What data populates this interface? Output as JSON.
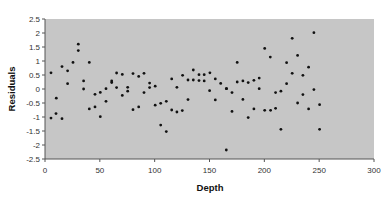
{
  "chart_data": {
    "type": "scatter",
    "title": "",
    "xlabel": "Depth",
    "ylabel": "Residuals",
    "xlim": [
      0,
      300
    ],
    "ylim": [
      -2.5,
      2.5
    ],
    "xticks": [
      0,
      50,
      100,
      150,
      200,
      250,
      300
    ],
    "yticks": [
      2.5,
      2,
      1.5,
      1,
      0.5,
      0,
      -0.5,
      -1,
      -1.5,
      -2,
      -2.5
    ],
    "ytick_labels": [
      "2.5",
      "2",
      "1.5",
      "1",
      "0.5",
      "0",
      "-0.5",
      "-1",
      "-1.5",
      "-2",
      "-2.5"
    ],
    "xtick_labels": [
      "0",
      "50",
      "100",
      "150",
      "200",
      "250",
      "300"
    ],
    "grid": false,
    "legend": null,
    "background": "#c6c6c6",
    "marker_color": "#111111",
    "points": [
      [
        5.5,
        0.58
      ],
      [
        10.3,
        -0.33
      ],
      [
        5.5,
        -1.04
      ],
      [
        10.0,
        -0.88
      ],
      [
        15.5,
        -1.06
      ],
      [
        15.5,
        0.8
      ],
      [
        20.6,
        0.65
      ],
      [
        20.6,
        0.19
      ],
      [
        25.5,
        0.95
      ],
      [
        30.4,
        1.6
      ],
      [
        30.4,
        1.37
      ],
      [
        40.4,
        0.95
      ],
      [
        35.2,
        0.29
      ],
      [
        35.2,
        0.0
      ],
      [
        45.6,
        -0.19
      ],
      [
        50.4,
        -0.12
      ],
      [
        55.6,
        0.01
      ],
      [
        55.6,
        -0.44
      ],
      [
        40.4,
        -0.71
      ],
      [
        45.6,
        -0.64
      ],
      [
        50.4,
        -0.99
      ],
      [
        65.3,
        0.57
      ],
      [
        70.5,
        0.52
      ],
      [
        80.2,
        0.55
      ],
      [
        85.4,
        0.45
      ],
      [
        90.3,
        0.56
      ],
      [
        60.8,
        0.29
      ],
      [
        60.8,
        0.23
      ],
      [
        95.4,
        0.21
      ],
      [
        100.5,
        0.1
      ],
      [
        95.4,
        0.05
      ],
      [
        65.3,
        0.05
      ],
      [
        75.4,
        0.06
      ],
      [
        75.4,
        -0.08
      ],
      [
        70.5,
        -0.23
      ],
      [
        90.3,
        -0.13
      ],
      [
        100.5,
        -0.58
      ],
      [
        105.5,
        -0.51
      ],
      [
        110.6,
        -0.44
      ],
      [
        85.4,
        -0.64
      ],
      [
        80.2,
        -0.74
      ],
      [
        105.5,
        -1.29
      ],
      [
        110.6,
        -1.52
      ],
      [
        115.5,
        0.36
      ],
      [
        125.5,
        0.49
      ],
      [
        135.2,
        0.68
      ],
      [
        130.4,
        0.32
      ],
      [
        135.2,
        0.32
      ],
      [
        140.4,
        0.51
      ],
      [
        145.2,
        0.51
      ],
      [
        140.4,
        0.3
      ],
      [
        145.2,
        0.29
      ],
      [
        150.4,
        0.58
      ],
      [
        155.3,
        0.36
      ],
      [
        160.2,
        0.2
      ],
      [
        120.3,
        0.06
      ],
      [
        150.1,
        -0.06
      ],
      [
        165.3,
        0.01
      ],
      [
        130.4,
        -0.38
      ],
      [
        155.3,
        -0.39
      ],
      [
        115.5,
        -0.75
      ],
      [
        120.3,
        -0.82
      ],
      [
        125.2,
        -0.77
      ],
      [
        165.3,
        -2.18
      ],
      [
        200.3,
        1.45
      ],
      [
        205.4,
        1.14
      ],
      [
        175.3,
        0.95
      ],
      [
        175.3,
        0.25
      ],
      [
        180.5,
        0.29
      ],
      [
        185.3,
        0.23
      ],
      [
        190.5,
        0.31
      ],
      [
        195.3,
        0.39
      ],
      [
        165.6,
        0.01
      ],
      [
        170.5,
        -0.13
      ],
      [
        195.3,
        0.01
      ],
      [
        180.5,
        -0.37
      ],
      [
        170.5,
        -0.8
      ],
      [
        190.5,
        -0.71
      ],
      [
        200.3,
        -0.76
      ],
      [
        185.3,
        -1.02
      ],
      [
        245.2,
        2.01
      ],
      [
        225.4,
        1.81
      ],
      [
        230.3,
        1.2
      ],
      [
        220.3,
        0.94
      ],
      [
        240.4,
        0.78
      ],
      [
        225.4,
        0.56
      ],
      [
        235.2,
        0.49
      ],
      [
        220.3,
        0.19
      ],
      [
        210.3,
        -0.13
      ],
      [
        215.1,
        -0.08
      ],
      [
        245.2,
        -0.02
      ],
      [
        235.2,
        -0.2
      ],
      [
        230.3,
        -0.5
      ],
      [
        250.4,
        -0.56
      ],
      [
        210.3,
        -0.69
      ],
      [
        240.4,
        -0.71
      ],
      [
        205.7,
        -0.76
      ],
      [
        215.1,
        -1.44
      ],
      [
        250.4,
        -1.44
      ]
    ]
  }
}
